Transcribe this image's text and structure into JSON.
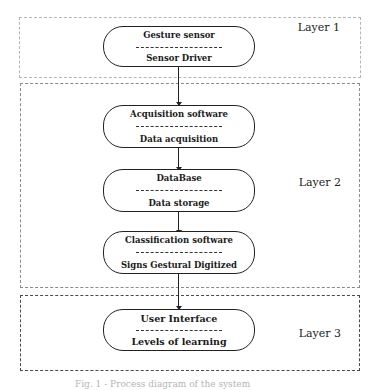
{
  "layers": [
    {
      "id": "layer-1",
      "label": "Layer 1"
    },
    {
      "id": "layer-2",
      "label": "Layer 2"
    },
    {
      "id": "layer-3",
      "label": "Layer 3"
    }
  ],
  "nodes": [
    {
      "id": "gesture-sensor",
      "title": "Gesture sensor",
      "separator": "------------------------",
      "subtitle": "Sensor Driver",
      "layer": "Layer 1"
    },
    {
      "id": "acquisition-software",
      "title": "Acquisition software",
      "separator": "------------------------",
      "subtitle": "Data acquisition",
      "layer": "Layer 2"
    },
    {
      "id": "database",
      "title": "DataBase",
      "separator": "------------------------",
      "subtitle": "Data storage",
      "layer": "Layer 2"
    },
    {
      "id": "classification-software",
      "title": "Classification software",
      "separator": "------------------------",
      "subtitle": "Signs Gestural Digitized",
      "layer": "Layer 2"
    },
    {
      "id": "user-interface",
      "title": "User Interface",
      "separator": "------------------------",
      "subtitle": "Levels of learning",
      "layer": "Layer 3"
    }
  ],
  "edges": [
    {
      "from": "gesture-sensor",
      "to": "acquisition-software"
    },
    {
      "from": "acquisition-software",
      "to": "database"
    },
    {
      "from": "database",
      "to": "classification-software"
    },
    {
      "from": "classification-software",
      "to": "user-interface"
    }
  ],
  "caption": "Fig. 1 - Process diagram of the system"
}
